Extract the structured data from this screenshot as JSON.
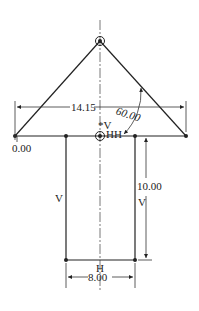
{
  "drawing": {
    "dimensions": {
      "width_top": "14.15",
      "angle": "60.00",
      "origin": "0.00",
      "height": "10.00",
      "width_bottom": "8.00"
    },
    "constraints": {
      "vertical_center": "V",
      "horizontal_center": "HH",
      "left_vertical": "V",
      "right_vertical": "V",
      "bottom_horizontal": "H"
    },
    "colors": {
      "line": "#222222",
      "background": "#ffffff"
    }
  }
}
